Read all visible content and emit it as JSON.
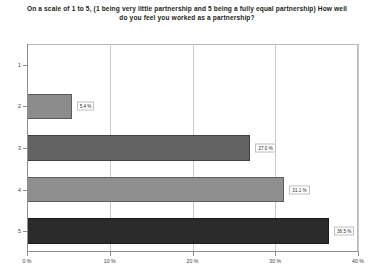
{
  "chart_data": {
    "type": "bar",
    "orientation": "horizontal",
    "title": "On a scale of 1 to 5, (1 being very little partnership and 5 being a fully equal partnership) How well do you feel you worked as a partnership?",
    "xlabel": "",
    "ylabel": "",
    "categories": [
      "1",
      "2",
      "3",
      "4",
      "5"
    ],
    "values": [
      0,
      5.4,
      27.0,
      31.1,
      36.5
    ],
    "data_labels": [
      "",
      "5.4 %",
      "27.0 %",
      "31.1 %",
      "36.5 %"
    ],
    "bar_colors": [
      "#9a9a9a",
      "#8c8c8c",
      "#636363",
      "#8f8f8f",
      "#2b2b2b"
    ],
    "xlim": [
      0,
      40
    ],
    "xticks": [
      0,
      10,
      20,
      30,
      40
    ],
    "xtick_labels": [
      "0 %",
      "10 %",
      "20 %",
      "30 %",
      "40 %"
    ],
    "grid": true,
    "grid_axis": "x",
    "legend": false
  }
}
